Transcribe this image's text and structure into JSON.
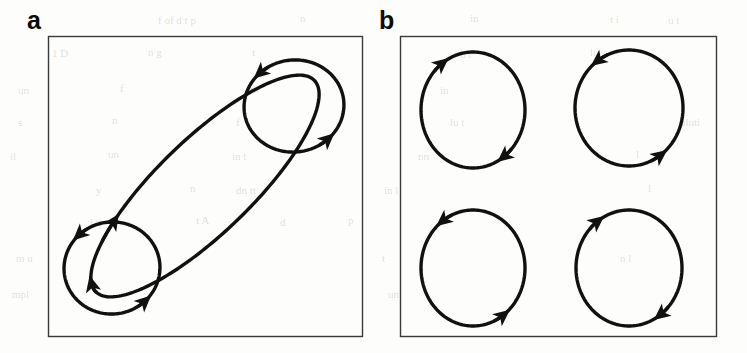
{
  "figure": {
    "type": "diagram",
    "background_color": "#fdfdfc",
    "stroke_color": "#111111",
    "panel_border_color": "#3a3a3a",
    "panels": [
      {
        "id": "a",
        "label": "a",
        "box": {
          "x": 48,
          "y": 36,
          "width": 314,
          "height": 300
        },
        "curves": [
          {
            "name": "large-tilted-ellipse",
            "shape": "ellipse",
            "cx": 205,
            "cy": 186,
            "rx": 152,
            "ry": 47,
            "rotation": -44,
            "orientation": "clockwise",
            "arrow_count": 2
          },
          {
            "name": "upper-right-circle",
            "shape": "ellipse",
            "cx": 294,
            "cy": 106,
            "rx": 50,
            "ry": 46,
            "rotation": -8,
            "orientation": "counterclockwise",
            "arrow_count": 2
          },
          {
            "name": "lower-left-circle",
            "shape": "ellipse",
            "cx": 112,
            "cy": 268,
            "rx": 48,
            "ry": 46,
            "rotation": -8,
            "orientation": "counterclockwise",
            "arrow_count": 2
          }
        ]
      },
      {
        "id": "b",
        "label": "b",
        "box": {
          "x": 400,
          "y": 36,
          "width": 316,
          "height": 300
        },
        "curves": [
          {
            "name": "top-left-circle",
            "shape": "ellipse",
            "cx": 473,
            "cy": 110,
            "rx": 52,
            "ry": 58,
            "rotation": 0,
            "orientation": "clockwise",
            "arrow_count": 2
          },
          {
            "name": "top-right-circle",
            "shape": "ellipse",
            "cx": 629,
            "cy": 108,
            "rx": 54,
            "ry": 58,
            "rotation": 0,
            "orientation": "counterclockwise",
            "arrow_count": 2
          },
          {
            "name": "bottom-left-circle",
            "shape": "ellipse",
            "cx": 473,
            "cy": 268,
            "rx": 52,
            "ry": 58,
            "rotation": 0,
            "orientation": "counterclockwise",
            "arrow_count": 2
          },
          {
            "name": "bottom-right-circle",
            "shape": "ellipse",
            "cx": 629,
            "cy": 268,
            "rx": 53,
            "ry": 58,
            "rotation": 0,
            "orientation": "clockwise",
            "arrow_count": 2
          }
        ]
      }
    ],
    "bleed_through_text": [
      {
        "text": "f  of   d  t  p",
        "x": 158,
        "y": 14
      },
      {
        "text": "n",
        "x": 300,
        "y": 12
      },
      {
        "text": "in",
        "x": 470,
        "y": 12
      },
      {
        "text": "t   i",
        "x": 610,
        "y": 13
      },
      {
        "text": "u  t",
        "x": 668,
        "y": 14
      },
      {
        "text": "1  D",
        "x": 52,
        "y": 47
      },
      {
        "text": "n  g",
        "x": 148,
        "y": 46
      },
      {
        "text": "t",
        "x": 252,
        "y": 46
      },
      {
        "text": "u   t",
        "x": 460,
        "y": 48
      },
      {
        "text": "lu",
        "x": 590,
        "y": 46
      },
      {
        "text": "un",
        "x": 18,
        "y": 84
      },
      {
        "text": "f",
        "x": 120,
        "y": 82
      },
      {
        "text": "th",
        "x": 250,
        "y": 83
      },
      {
        "text": "in",
        "x": 440,
        "y": 84
      },
      {
        "text": "s",
        "x": 18,
        "y": 116
      },
      {
        "text": "n",
        "x": 112,
        "y": 114
      },
      {
        "text": "f",
        "x": 236,
        "y": 116
      },
      {
        "text": "lu t",
        "x": 450,
        "y": 116
      },
      {
        "text": "uluti",
        "x": 680,
        "y": 116
      },
      {
        "text": "il",
        "x": 10,
        "y": 150
      },
      {
        "text": "un",
        "x": 108,
        "y": 148
      },
      {
        "text": "in  t",
        "x": 232,
        "y": 150
      },
      {
        "text": "nn",
        "x": 418,
        "y": 150
      },
      {
        "text": "l",
        "x": 636,
        "y": 148
      },
      {
        "text": "y",
        "x": 96,
        "y": 184
      },
      {
        "text": "n",
        "x": 190,
        "y": 182
      },
      {
        "text": "dn  tt",
        "x": 236,
        "y": 184
      },
      {
        "text": "in  l",
        "x": 384,
        "y": 184
      },
      {
        "text": "l",
        "x": 648,
        "y": 182
      },
      {
        "text": "i  ti",
        "x": 90,
        "y": 216
      },
      {
        "text": "t A",
        "x": 196,
        "y": 214
      },
      {
        "text": "d",
        "x": 280,
        "y": 216
      },
      {
        "text": "p",
        "x": 348,
        "y": 214
      },
      {
        "text": "l l",
        "x": 592,
        "y": 216
      },
      {
        "text": "m  u",
        "x": 16,
        "y": 252
      },
      {
        "text": "t",
        "x": 382,
        "y": 252
      },
      {
        "text": "n  l",
        "x": 620,
        "y": 252
      },
      {
        "text": "mpl",
        "x": 12,
        "y": 288
      },
      {
        "text": "un",
        "x": 388,
        "y": 288
      }
    ]
  }
}
